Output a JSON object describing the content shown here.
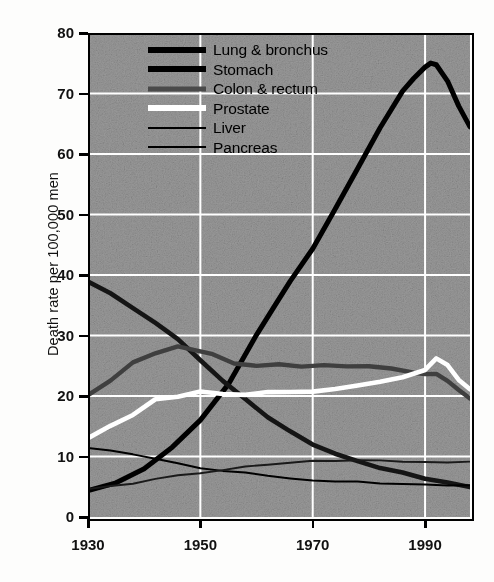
{
  "chart_data": {
    "type": "line",
    "title": "",
    "xlabel": "",
    "ylabel": "Death rate per 100,000 men",
    "xlim": [
      1930,
      1998
    ],
    "ylim": [
      0,
      80
    ],
    "xticks": [
      1930,
      1950,
      1970,
      1990
    ],
    "yticks": [
      0,
      10,
      20,
      30,
      40,
      50,
      60,
      70,
      80
    ],
    "grid": true,
    "grid_color": "#ffffff",
    "plot_background": "#9a9a9a",
    "legend_position": "top-left",
    "series": [
      {
        "name": "Lung & bronchus",
        "color": "#000000",
        "width": 5.0,
        "x": [
          1930,
          1935,
          1940,
          1945,
          1950,
          1955,
          1960,
          1963,
          1966,
          1970,
          1974,
          1978,
          1982,
          1986,
          1988,
          1990,
          1991,
          1992,
          1994,
          1996,
          1998
        ],
        "values": [
          4.5,
          5.5,
          8.0,
          11.5,
          16.0,
          22.0,
          30.0,
          34.5,
          39.0,
          44.5,
          51.0,
          57.5,
          64.5,
          70.5,
          72.5,
          74.5,
          75.0,
          74.8,
          72.0,
          68.0,
          64.5
        ]
      },
      {
        "name": "Stomach",
        "color": "#151515",
        "width": 4.6,
        "x": [
          1930,
          1934,
          1938,
          1942,
          1946,
          1950,
          1954,
          1958,
          1962,
          1966,
          1970,
          1974,
          1978,
          1982,
          1986,
          1990,
          1994,
          1998
        ],
        "values": [
          39.0,
          37.0,
          34.5,
          32.0,
          29.5,
          26.0,
          22.5,
          19.5,
          16.5,
          14.0,
          12.0,
          10.5,
          9.2,
          8.2,
          7.3,
          6.3,
          5.6,
          5.1
        ]
      },
      {
        "name": "Colon & rectum",
        "color": "#3f3f3f",
        "width": 4.4,
        "x": [
          1930,
          1934,
          1938,
          1942,
          1946,
          1948,
          1952,
          1956,
          1960,
          1964,
          1968,
          1972,
          1976,
          1980,
          1984,
          1988,
          1990,
          1992,
          1994,
          1996,
          1998
        ],
        "values": [
          20.0,
          22.5,
          25.5,
          27.2,
          28.2,
          27.8,
          27.0,
          25.4,
          25.0,
          25.2,
          25.0,
          25.2,
          24.8,
          25.0,
          24.6,
          24.0,
          23.6,
          23.8,
          22.5,
          21.0,
          19.6
        ]
      },
      {
        "name": "Prostate",
        "color": "#ffffff",
        "width": 4.6,
        "x": [
          1930,
          1934,
          1938,
          1942,
          1946,
          1950,
          1954,
          1958,
          1962,
          1966,
          1970,
          1974,
          1978,
          1982,
          1986,
          1990,
          1992,
          1994,
          1996,
          1998
        ],
        "values": [
          13.0,
          15.0,
          17.0,
          19.5,
          20.0,
          20.8,
          20.2,
          20.3,
          20.5,
          20.6,
          20.8,
          21.2,
          21.6,
          22.2,
          23.0,
          24.3,
          26.2,
          25.0,
          22.5,
          21.0
        ]
      },
      {
        "name": "Liver",
        "color": "#000000",
        "width": 2.0,
        "x": [
          1930,
          1934,
          1938,
          1942,
          1946,
          1950,
          1954,
          1958,
          1962,
          1966,
          1970,
          1974,
          1978,
          1982,
          1986,
          1990,
          1994,
          1998
        ],
        "values": [
          11.5,
          11.0,
          10.2,
          9.5,
          8.8,
          8.2,
          7.6,
          7.2,
          6.8,
          6.4,
          6.1,
          5.9,
          5.7,
          5.5,
          5.4,
          5.3,
          5.2,
          5.2
        ]
      },
      {
        "name": "Pancreas",
        "color": "#1a1a1a",
        "width": 1.9,
        "x": [
          1930,
          1934,
          1938,
          1942,
          1946,
          1950,
          1954,
          1958,
          1962,
          1966,
          1970,
          1974,
          1978,
          1982,
          1986,
          1990,
          1994,
          1998
        ],
        "values": [
          4.5,
          5.0,
          5.6,
          6.2,
          6.8,
          7.3,
          7.9,
          8.4,
          8.8,
          9.1,
          9.3,
          9.4,
          9.4,
          9.3,
          9.2,
          9.1,
          9.0,
          9.0
        ]
      }
    ]
  },
  "axis": {
    "ylabel": "Death rate per 100,000 men",
    "yticks": [
      "80",
      "70",
      "60",
      "50",
      "40",
      "30",
      "20",
      "10",
      "0"
    ],
    "xticks": [
      "1930",
      "1950",
      "1970",
      "1990"
    ]
  },
  "legend": {
    "items": [
      {
        "label": "Lung & bronchus",
        "style": "thick-black"
      },
      {
        "label": "Stomach",
        "style": "thick-black"
      },
      {
        "label": "Colon & rectum",
        "style": "thick-gray"
      },
      {
        "label": "Prostate",
        "style": "thick-white"
      },
      {
        "label": "Liver",
        "style": "thin-black"
      },
      {
        "label": "Pancreas",
        "style": "thin-black"
      }
    ]
  }
}
